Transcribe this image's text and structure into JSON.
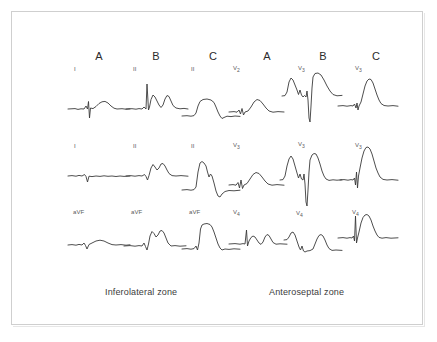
{
  "figure": {
    "type": "ecg-waveform-figure",
    "background_color": "#ffffff",
    "frame_color": "#cfcfcf",
    "trace_color": "#3a3a3a"
  },
  "panels": [
    {
      "id": "inferolateral",
      "caption": "Inferolateral zone",
      "columns": [
        {
          "label": "A"
        },
        {
          "label": "B"
        },
        {
          "label": "C"
        }
      ],
      "rows": [
        {
          "leads": [
            "I",
            "II",
            "II"
          ]
        },
        {
          "leads": [
            "I",
            "II",
            "II"
          ]
        },
        {
          "leads": [
            "aVF",
            "aVF",
            "aVF"
          ]
        }
      ]
    },
    {
      "id": "anteroseptal",
      "caption": "Anteroseptal zone",
      "columns": [
        {
          "label": "A"
        },
        {
          "label": "B"
        },
        {
          "label": "C"
        }
      ],
      "rows": [
        {
          "leads": [
            "V2",
            "V3",
            "V3"
          ]
        },
        {
          "leads": [
            "V3",
            "V3",
            "V3"
          ]
        },
        {
          "leads": [
            "V4",
            "V4",
            "V4"
          ]
        }
      ]
    }
  ],
  "lead_labels": {
    "inferolateral": {
      "r0c0": "I",
      "r0c1": "II",
      "r0c2": "II",
      "r1c0": "I",
      "r1c1": "II",
      "r1c2": "II",
      "r2c0": "aVF",
      "r2c1": "aVF",
      "r2c2": "aVF"
    },
    "anteroseptal": {
      "r0c0": "V",
      "r0c1": "V",
      "r0c2": "V",
      "r1c0": "V",
      "r1c1": "V",
      "r1c2": "V",
      "r2c0": "V",
      "r2c1": "V",
      "r2c2": "V"
    }
  },
  "lead_subscripts": {
    "anteroseptal": {
      "r0c0": "2",
      "r0c1": "3",
      "r0c2": "3",
      "r1c0": "3",
      "r1c1": "3",
      "r1c2": "3",
      "r2c0": "4",
      "r2c1": "4",
      "r2c2": "4"
    }
  },
  "column_headers": {
    "left_a": "A",
    "left_b": "B",
    "left_c": "C",
    "right_a": "A",
    "right_b": "B",
    "right_c": "C"
  },
  "captions": {
    "left": "Inferolateral zone",
    "right": "Anteroseptal zone"
  }
}
